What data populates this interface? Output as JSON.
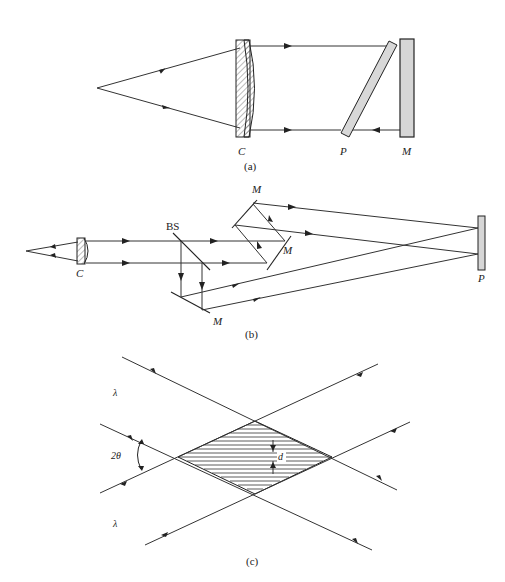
{
  "figure": {
    "panels": [
      {
        "id": "a",
        "caption": "(a)",
        "labels": {
          "collimator": "C",
          "plate": "P",
          "mirror": "M"
        },
        "components": [
          "point-source",
          "collimating-lens",
          "tilted-plate",
          "plane-mirror"
        ]
      },
      {
        "id": "b",
        "caption": "(b)",
        "labels": {
          "collimator": "C",
          "beamsplitter": "BS",
          "mirror_top": "M",
          "mirror_mid": "M",
          "mirror_bottom": "M",
          "plate": "P"
        },
        "components": [
          "point-source",
          "collimating-lens",
          "beam-splitter",
          "mirror",
          "mirror",
          "mirror",
          "plate"
        ]
      },
      {
        "id": "c",
        "caption": "(c)",
        "labels": {
          "wavelength_top": "λ",
          "wavelength_bottom": "λ",
          "angle": "2θ",
          "fringe_spacing": "d"
        },
        "components": [
          "beam-1",
          "beam-2",
          "interference-region"
        ]
      }
    ],
    "colors": {
      "line": "#333333",
      "component_fill": "#d6d6d6",
      "background": "#ffffff"
    }
  }
}
